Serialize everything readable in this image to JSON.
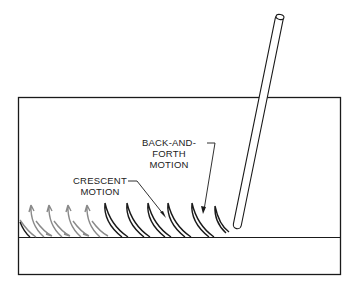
{
  "diagram": {
    "labels": {
      "back_and_forth_line1": "BACK-AND-FORTH",
      "back_and_forth_line2": "MOTION",
      "crescent_line1": "CRESCENT",
      "crescent_line2": "MOTION"
    },
    "colors": {
      "line": "#1a1a1a",
      "gray_arrows": "#8a8a8a"
    }
  }
}
